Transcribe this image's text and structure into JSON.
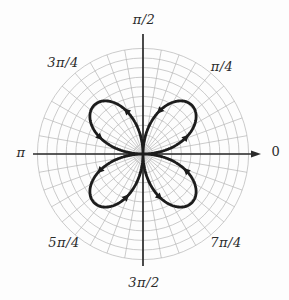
{
  "chart_data": {
    "type": "line",
    "coordinate_system": "polar",
    "r_function": "r = sin(2*theta)",
    "amplitude": 1,
    "theta_range_deg": [
      0,
      360
    ],
    "petal_count": 4,
    "petal_axes_deg": [
      45,
      135,
      225,
      315
    ],
    "petal_tip_radius": 1,
    "angle_labels": {
      "e": "0",
      "ne": "π/4",
      "n": "π/2",
      "nw": "3π/4",
      "w": "π",
      "sw": "5π/4",
      "s": "3π/2",
      "se": "7π/4"
    },
    "grid": {
      "visible": true,
      "circle_count": 11,
      "circle_spacing_px": 9.6,
      "spoke_step_deg": 10
    },
    "center_px": [
      143,
      154
    ],
    "amplitude_px": 69,
    "axes": {
      "x_left": 33,
      "x_right": 252,
      "y_top": 34,
      "y_bottom": 266,
      "x_arrowhead": true
    },
    "arrows_theta_deg": [
      21,
      69,
      111,
      159,
      201,
      249,
      291,
      339
    ],
    "colors": {
      "grid": "#b4b4b4",
      "axis": "#2b2b2b",
      "curve": "#1c1c1c",
      "background": "#fdfdfd"
    }
  }
}
